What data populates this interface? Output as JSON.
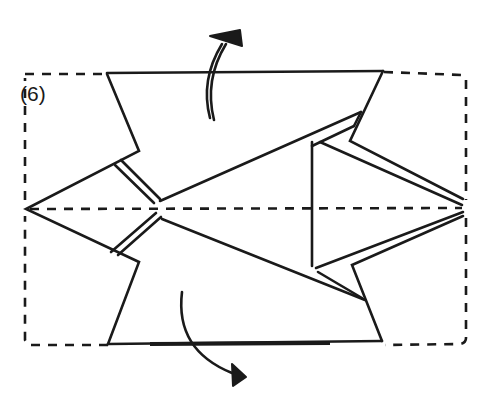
{
  "diagram": {
    "step_label": "(6)",
    "type": "origami-fold-step",
    "line_color": "#1a1a1a",
    "background": "#ffffff",
    "elements": {
      "outline": "dashed rectangle (folded-back edge)",
      "center_line": "horizontal valley-fold dashed line",
      "arrows": [
        {
          "position": "top",
          "direction": "fold up and back"
        },
        {
          "position": "bottom",
          "direction": "fold down and back"
        }
      ]
    }
  }
}
